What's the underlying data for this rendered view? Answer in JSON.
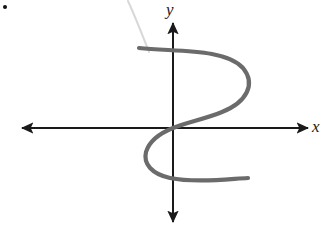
{
  "figure": {
    "kind": "hand-drawn-graph",
    "background_color": "#ffffff",
    "bullet_marker": {
      "name": "bullet-point",
      "x": 5,
      "y": 7,
      "radius": 2,
      "color": "#111111"
    },
    "axes": {
      "color": "#1a1a1a",
      "stroke_width": 2,
      "origin": {
        "x": 173,
        "y": 128
      },
      "x_axis": {
        "label": "x",
        "label_position": {
          "x": 318,
          "y": 128
        },
        "from": {
          "x": 22,
          "y": 128
        },
        "to": {
          "x": 308,
          "y": 128
        },
        "arrow_start": true,
        "arrow_end": true
      },
      "y_axis": {
        "label": "y",
        "label_position": {
          "x": 172,
          "y": 10
        },
        "from": {
          "x": 173,
          "y": 23
        },
        "to": {
          "x": 173,
          "y": 222
        },
        "arrow_start": true,
        "arrow_end": true
      }
    },
    "curve": {
      "name": "sideways-s-curve",
      "color": "#6b6b6b",
      "stroke_width": 4.2,
      "description": "Hand-drawn sideways S (fails the vertical line test)",
      "path": "M 139 48 C 175 52, 225 48, 243 68 C 256 84, 247 102, 222 112 C 205 119, 188 122, 173 128 C 158 134, 149 142, 146 152 C 143 164, 152 174, 170 178 C 195 183, 228 179, 248 178"
    },
    "pencil_mark": {
      "name": "faint-pencil-stroke",
      "color": "#d8d8d8",
      "stroke_width": 2,
      "path": "M 128 1 C 134 14, 142 34, 149 52"
    }
  }
}
